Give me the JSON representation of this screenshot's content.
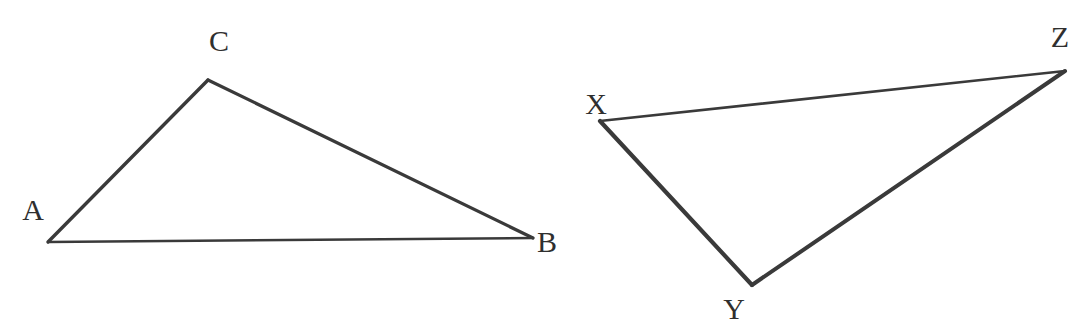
{
  "figure": {
    "background_color": "#ffffff",
    "stroke_color": "#3a3a3a",
    "label_color": "#2f2f2f",
    "width": 1084,
    "height": 330,
    "shapes": [
      {
        "name": "triangle-abc",
        "vertices": [
          {
            "label": "A",
            "x": 48,
            "y": 242,
            "label_x": 33,
            "label_y": 210
          },
          {
            "label": "B",
            "x": 533,
            "y": 238,
            "label_x": 547,
            "label_y": 242
          },
          {
            "label": "C",
            "x": 208,
            "y": 80,
            "label_x": 219,
            "label_y": 41
          }
        ],
        "edges": [
          {
            "name": "edge-ac",
            "from": "A",
            "to": "C",
            "width": 3.4
          },
          {
            "name": "edge-cb",
            "from": "C",
            "to": "B",
            "width": 3.2
          },
          {
            "name": "edge-ab",
            "from": "A",
            "to": "B",
            "width": 2.4
          }
        ]
      },
      {
        "name": "triangle-xyz",
        "vertices": [
          {
            "label": "X",
            "x": 600,
            "y": 121,
            "label_x": 596,
            "label_y": 104
          },
          {
            "label": "Y",
            "x": 752,
            "y": 285,
            "label_x": 734,
            "label_y": 309
          },
          {
            "label": "Z",
            "x": 1065,
            "y": 71,
            "label_x": 1060,
            "label_y": 37
          }
        ],
        "edges": [
          {
            "name": "edge-xz",
            "from": "X",
            "to": "Z",
            "width": 2.6
          },
          {
            "name": "edge-xy",
            "from": "X",
            "to": "Y",
            "width": 4.2
          },
          {
            "name": "edge-yz",
            "from": "Y",
            "to": "Z",
            "width": 4.0
          }
        ]
      }
    ]
  }
}
